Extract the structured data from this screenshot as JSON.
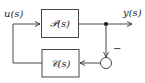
{
  "diagram": {
    "type": "feedback-block-diagram",
    "input_label": "u(s)",
    "output_label": "y(s)",
    "forward_block": {
      "label": "𝒫(s)"
    },
    "feedback_block": {
      "label": "𝒞(s)"
    },
    "summing_junction": {
      "sign": "−"
    },
    "colors": {
      "line": "#333333",
      "box_fill": "#ffffff",
      "background": "#ffffff"
    }
  }
}
